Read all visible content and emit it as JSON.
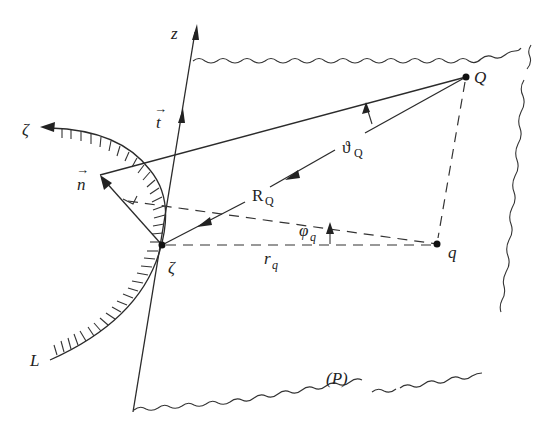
{
  "figure": {
    "labels": {
      "z_axis": "z",
      "t_vector": "t",
      "n_vector": "n",
      "zeta_curve_end": "ζ",
      "zeta_point": "ζ",
      "Q_point": "Q",
      "q_point": "q",
      "theta_base": "ϑ",
      "theta_sub": "Q",
      "R_base": "R",
      "R_sub": "Q",
      "phi_base": "φ",
      "phi_sub": "q",
      "r_base": "r",
      "r_sub": "q",
      "curve_L": "L",
      "plane": "(P)"
    },
    "vector_arrow_glyph": "→",
    "colors": {
      "ink": "#2b2b2b",
      "background": "#ffffff"
    }
  }
}
